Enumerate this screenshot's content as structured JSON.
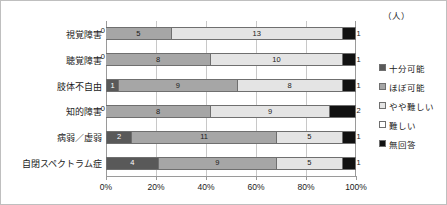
{
  "chart_data": {
    "type": "bar",
    "subtype": "stacked-horizontal-100-percent",
    "title": "",
    "xlabel": "",
    "ylabel": "",
    "unit_caption": "（人）",
    "xlim": [
      0,
      100
    ],
    "xticks": [
      "0%",
      "20%",
      "40%",
      "60%",
      "80%",
      "100%"
    ],
    "grid": true,
    "legend_position": "right",
    "categories": [
      "視覚障害",
      "聴覚障害",
      "肢体不自由",
      "知的障害",
      "病弱／虚弱",
      "自閉スペクトラム症"
    ],
    "series": [
      {
        "name": "十分可能",
        "color": "#595959",
        "values": [
          0,
          0,
          1,
          0,
          2,
          4
        ]
      },
      {
        "name": "ほぼ可能",
        "color": "#a6a6a6",
        "values": [
          5,
          8,
          9,
          8,
          11,
          9
        ]
      },
      {
        "name": "やや難しい",
        "color": "#e4e4e4",
        "values": [
          13,
          10,
          8,
          9,
          5,
          5
        ]
      },
      {
        "name": "難しい",
        "color": "#ffffff",
        "values": [
          0,
          0,
          0,
          0,
          0,
          0
        ]
      },
      {
        "name": "無回答",
        "color": "#111111",
        "values": [
          1,
          1,
          1,
          2,
          1,
          1
        ]
      }
    ],
    "row_totals": [
      19,
      19,
      19,
      19,
      19,
      19
    ],
    "rows": [
      {
        "label": "視覚障害",
        "zero_label": "0",
        "segments": [
          {
            "series": "ほぼ可能",
            "color_index": 1,
            "value": 5,
            "label": "5",
            "percent": 26.3
          },
          {
            "series": "やや難しい",
            "color_index": 2,
            "value": 13,
            "label": "13",
            "percent": 68.4
          },
          {
            "series": "無回答",
            "color_index": 4,
            "value": 1,
            "label": "1",
            "percent": 5.3,
            "label_outside": true
          }
        ]
      },
      {
        "label": "聴覚障害",
        "zero_label": "0",
        "segments": [
          {
            "series": "ほぼ可能",
            "color_index": 1,
            "value": 8,
            "label": "8",
            "percent": 42.1
          },
          {
            "series": "やや難しい",
            "color_index": 2,
            "value": 10,
            "label": "10",
            "percent": 52.6
          },
          {
            "series": "無回答",
            "color_index": 4,
            "value": 1,
            "label": "1",
            "percent": 5.3,
            "label_outside": true
          }
        ]
      },
      {
        "label": "肢体不自由",
        "zero_label": "",
        "segments": [
          {
            "series": "十分可能",
            "color_index": 0,
            "value": 1,
            "label": "1",
            "percent": 5.3
          },
          {
            "series": "ほぼ可能",
            "color_index": 1,
            "value": 9,
            "label": "9",
            "percent": 47.4
          },
          {
            "series": "やや難しい",
            "color_index": 2,
            "value": 8,
            "label": "8",
            "percent": 42.1
          },
          {
            "series": "無回答",
            "color_index": 4,
            "value": 1,
            "label": "1",
            "percent": 5.3,
            "label_outside": true
          }
        ]
      },
      {
        "label": "知的障害",
        "zero_label": "0",
        "segments": [
          {
            "series": "ほぼ可能",
            "color_index": 1,
            "value": 8,
            "label": "8",
            "percent": 42.1
          },
          {
            "series": "やや難しい",
            "color_index": 2,
            "value": 9,
            "label": "9",
            "percent": 47.4
          },
          {
            "series": "無回答",
            "color_index": 4,
            "value": 2,
            "label": "2",
            "percent": 10.5,
            "label_outside": true
          }
        ]
      },
      {
        "label": "病弱／虚弱",
        "zero_label": "",
        "segments": [
          {
            "series": "十分可能",
            "color_index": 0,
            "value": 2,
            "label": "2",
            "percent": 10.5
          },
          {
            "series": "ほぼ可能",
            "color_index": 1,
            "value": 11,
            "label": "11",
            "percent": 57.9
          },
          {
            "series": "やや難しい",
            "color_index": 2,
            "value": 5,
            "label": "5",
            "percent": 26.3
          },
          {
            "series": "無回答",
            "color_index": 4,
            "value": 1,
            "label": "1",
            "percent": 5.3,
            "label_outside": true
          }
        ]
      },
      {
        "label": "自閉スペクトラム症",
        "zero_label": "",
        "segments": [
          {
            "series": "十分可能",
            "color_index": 0,
            "value": 4,
            "label": "4",
            "percent": 21.1
          },
          {
            "series": "ほぼ可能",
            "color_index": 1,
            "value": 9,
            "label": "9",
            "percent": 47.4
          },
          {
            "series": "やや難しい",
            "color_index": 2,
            "value": 5,
            "label": "5",
            "percent": 26.3
          },
          {
            "series": "無回答",
            "color_index": 4,
            "value": 1,
            "label": "1",
            "percent": 5.3,
            "label_outside": true
          }
        ]
      }
    ],
    "legend": [
      {
        "label": "十分可能",
        "color_index": 0
      },
      {
        "label": "ほぼ可能",
        "color_index": 1
      },
      {
        "label": "やや難しい",
        "color_index": 2
      },
      {
        "label": "難しい",
        "color_index": 3
      },
      {
        "label": "無回答",
        "color_index": 4
      }
    ]
  }
}
